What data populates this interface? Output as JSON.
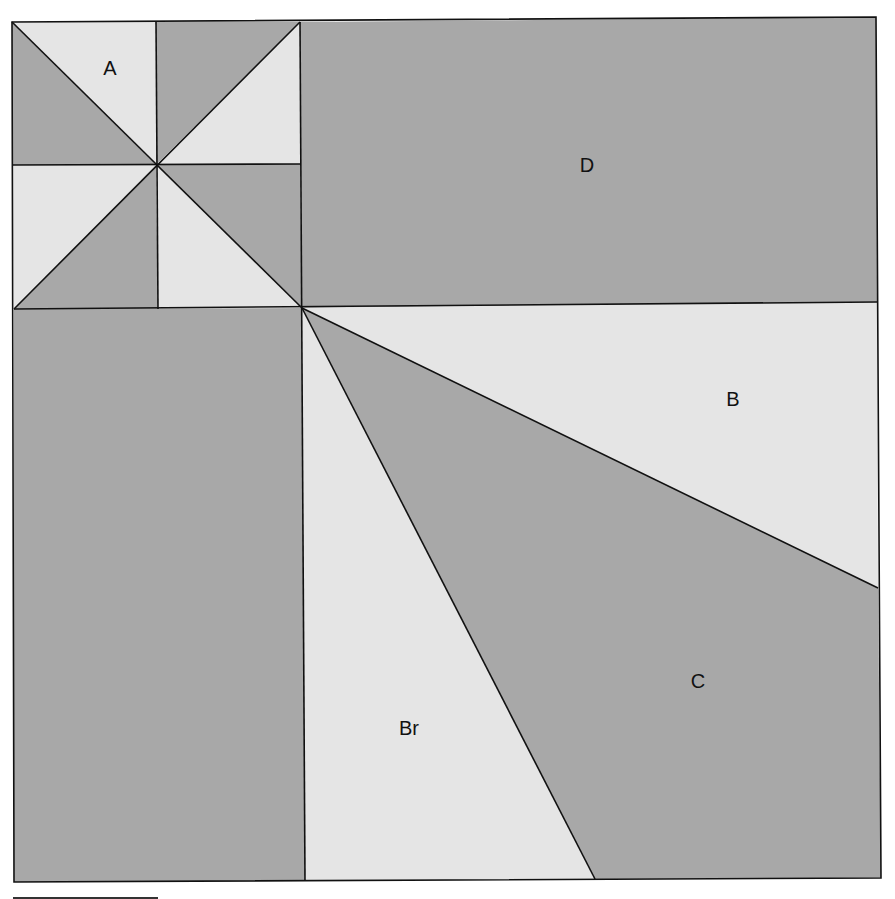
{
  "diagram": {
    "type": "quilt-block-layout",
    "colors": {
      "dark": "#a8a8a8",
      "light": "#e5e5e5",
      "line": "#111111",
      "background": "#ffffff"
    },
    "labels": {
      "A": "A",
      "D": "D",
      "B": "B",
      "C": "C",
      "Br": "Br"
    },
    "regions": [
      {
        "id": "A",
        "description": "pinwheel block, top-left, 8 half-square triangles"
      },
      {
        "id": "D",
        "description": "dark rectangle, top-right"
      },
      {
        "id": "left-rect",
        "description": "dark rectangle, bottom-left (unlabeled)"
      },
      {
        "id": "B",
        "description": "light triangle, right"
      },
      {
        "id": "C",
        "description": "dark quadrilateral, bottom-right"
      },
      {
        "id": "Br",
        "description": "light triangle, bottom-center"
      }
    ],
    "scale_bar": true
  }
}
